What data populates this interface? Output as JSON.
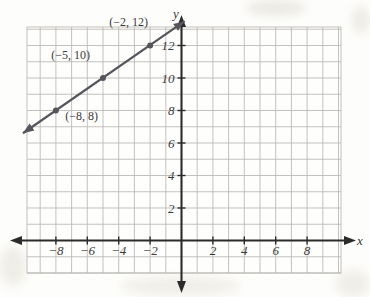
{
  "figure": {
    "kind": "coordinate-plane-line-graph",
    "background_color": "#fdfdfb",
    "grid_color": "#b9b7b2",
    "axis_color": "#2b2b2b",
    "line_color": "#55555c",
    "label_color": "#3a3a3a"
  },
  "axes": {
    "x_label": "x",
    "y_label": "y",
    "x_ticks": [
      "-8",
      "-6",
      "-4",
      "-2",
      "2",
      "4",
      "6",
      "8"
    ],
    "x_tick_values": [
      -8,
      -6,
      -4,
      -2,
      2,
      4,
      6,
      8
    ],
    "y_ticks": [
      "2",
      "4",
      "6",
      "8",
      "10",
      "12"
    ],
    "y_tick_values": [
      2,
      4,
      6,
      8,
      10,
      12
    ],
    "x_range": [
      -10,
      10
    ],
    "y_range": [
      -2,
      14
    ],
    "grid": "on",
    "grid_step": 1
  },
  "chart_data": {
    "type": "line",
    "title": "",
    "xlabel": "x",
    "ylabel": "y",
    "grid": true,
    "legend": "none",
    "xlim": [
      -10,
      10
    ],
    "ylim": [
      -2,
      14
    ],
    "xticks": [
      -8,
      -6,
      -4,
      -2,
      2,
      4,
      6,
      8
    ],
    "yticks": [
      2,
      4,
      6,
      8,
      10,
      12
    ],
    "series": [
      {
        "name": "line",
        "style": "solid-double-arrow",
        "slope": 0.6667,
        "intercept": 13.3333,
        "x": [
          -10.1,
          0.2
        ],
        "y": [
          6.6,
          13.5
        ],
        "points": [
          {
            "x": -8,
            "y": 8,
            "label": "(−8, 8)"
          },
          {
            "x": -5,
            "y": 10,
            "label": "(−5, 10)"
          },
          {
            "x": -2,
            "y": 12,
            "label": "(−2, 12)"
          }
        ]
      }
    ],
    "annotations": [
      {
        "text": "(−2, 12)",
        "x": -4.6,
        "y": 13.2
      },
      {
        "text": "(−5, 10)",
        "x": -8.3,
        "y": 11.2
      },
      {
        "text": "(−8, 8)",
        "x": -7.4,
        "y": 7.4
      }
    ]
  }
}
